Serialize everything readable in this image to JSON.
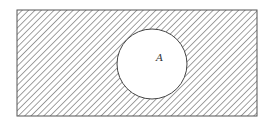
{
  "diagram": {
    "type": "venn",
    "universe": {
      "x": 17,
      "y": 10,
      "width": 240,
      "height": 106,
      "shaded": true
    },
    "sets": [
      {
        "label": "A",
        "cx": 152,
        "cy": 64,
        "r": 35,
        "shaded": false,
        "label_x": 158,
        "label_y": 61
      }
    ],
    "hatch": {
      "direction": "down-right",
      "spacing": 4.5,
      "color": "#8a8a8a"
    },
    "colors": {
      "border": "#555555",
      "background": "#ffffff"
    }
  }
}
